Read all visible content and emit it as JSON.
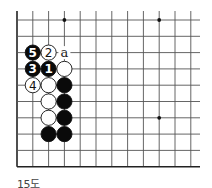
{
  "diagram": {
    "caption": "15도",
    "grid": {
      "x_lines": [
        17,
        32.8,
        48.6,
        64.4,
        80.2,
        96,
        111.8,
        127.6,
        143.4,
        159.2,
        175,
        190.8
      ],
      "y_lines": [
        20,
        36.3,
        52.6,
        68.9,
        85.2,
        101.5,
        117.8,
        134.1,
        150.4,
        166.7
      ],
      "top_extent": 11,
      "right_extent": 200,
      "left_edge_x": 17,
      "bottom_edge_y": 166.7,
      "line_color": "#555555",
      "edge_color": "#222222"
    },
    "hoshi": [
      {
        "col": 3,
        "row": 0
      },
      {
        "col": 9,
        "row": 0
      },
      {
        "col": 9,
        "row": 6
      }
    ],
    "stones": [
      {
        "col": 1,
        "row": 2,
        "color": "black",
        "label": "5"
      },
      {
        "col": 2,
        "row": 2,
        "color": "white",
        "label": "2"
      },
      {
        "col": 1,
        "row": 3,
        "color": "black",
        "label": "3"
      },
      {
        "col": 2,
        "row": 3,
        "color": "black",
        "label": "1"
      },
      {
        "col": 3,
        "row": 3,
        "color": "white",
        "label": ""
      },
      {
        "col": 1,
        "row": 4,
        "color": "white",
        "label": "4"
      },
      {
        "col": 2,
        "row": 4,
        "color": "white",
        "label": ""
      },
      {
        "col": 3,
        "row": 4,
        "color": "black",
        "label": ""
      },
      {
        "col": 2,
        "row": 5,
        "color": "white",
        "label": ""
      },
      {
        "col": 3,
        "row": 5,
        "color": "black",
        "label": ""
      },
      {
        "col": 2,
        "row": 6,
        "color": "white",
        "label": ""
      },
      {
        "col": 3,
        "row": 6,
        "color": "black",
        "label": ""
      },
      {
        "col": 2,
        "row": 7,
        "color": "black",
        "label": ""
      },
      {
        "col": 3,
        "row": 7,
        "color": "black",
        "label": ""
      }
    ],
    "markers": [
      {
        "col": 3,
        "row": 2,
        "label": "a"
      }
    ],
    "stone_radius": 7.6
  }
}
